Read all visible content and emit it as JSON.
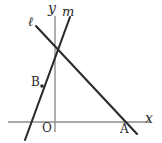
{
  "figure": {
    "canvas": {
      "width": 162,
      "height": 143
    },
    "colors": {
      "background": "#ffffff",
      "axis": "#8d8d8d",
      "line": "#2b2b2b",
      "label": "#2b2b2b"
    },
    "axes": {
      "x_axis": {
        "label": "x",
        "x1": 8,
        "y1": 122,
        "x2": 150,
        "y2": 122,
        "stroke_width": 1.4
      },
      "y_axis": {
        "label": "y",
        "x1": 55,
        "y1": 16,
        "x2": 55,
        "y2": 132,
        "stroke_width": 1.4
      }
    },
    "lines": [
      {
        "name": "line-l",
        "label": "ℓ",
        "x1": 36,
        "y1": 26,
        "x2": 137,
        "y2": 134,
        "stroke_width": 2.1
      },
      {
        "name": "line-m",
        "label": "m",
        "x1": 70,
        "y1": 17,
        "x2": 25,
        "y2": 140,
        "stroke_width": 2.1
      }
    ],
    "points": [
      {
        "name": "origin",
        "label": "O",
        "x": 55,
        "y": 122,
        "marked": false
      },
      {
        "name": "point-a",
        "label": "A",
        "x": 128,
        "y": 122,
        "marked": false
      },
      {
        "name": "point-b",
        "label": "B",
        "x": 42,
        "y": 86,
        "marked": true,
        "radius": 1.8
      }
    ],
    "labels": {
      "axis_x": "x",
      "axis_y": "y",
      "line_l": "ℓ",
      "line_m": "m",
      "origin": "O",
      "point_a": "A",
      "point_b": "B"
    }
  }
}
